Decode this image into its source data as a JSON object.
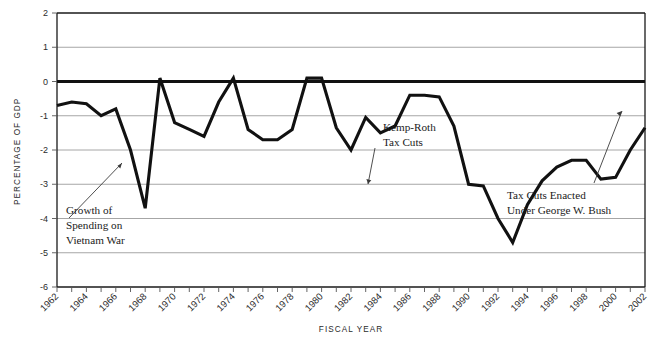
{
  "chart_data": {
    "type": "line",
    "title": "",
    "xlabel": "FISCAL YEAR",
    "ylabel": "PERCENTAGE OF GDP",
    "ylim": [
      -6,
      2
    ],
    "xlim": [
      1962,
      2002
    ],
    "ytick_values": [
      2,
      1,
      0,
      -1,
      -2,
      -3,
      -4,
      -5,
      -6
    ],
    "ytick_labels": [
      "2",
      "1",
      "0",
      "-1",
      "-2",
      "-3",
      "-4",
      "-5",
      "-6"
    ],
    "xtick_labels": [
      "1962",
      "1964",
      "1966",
      "1968",
      "1970",
      "1972",
      "1974",
      "1976",
      "1978",
      "1980",
      "1982",
      "1984",
      "1986",
      "1988",
      "1990",
      "1992",
      "1994",
      "1996",
      "1998",
      "2000",
      "2002"
    ],
    "grid": "horizontal",
    "legend": "none",
    "zero_reference_line": true,
    "series": [
      {
        "name": "Surplus or Deficit as Percentage of GDP",
        "color": "#111111",
        "x": [
          1962,
          1963,
          1964,
          1965,
          1966,
          1967,
          1968,
          1969,
          1970,
          1971,
          1972,
          1973,
          1974,
          1975,
          1976,
          1977,
          1978,
          1979,
          1980,
          1981,
          1982,
          1983,
          1984,
          1985,
          1986,
          1987,
          1988,
          1989,
          1990,
          1991,
          1992,
          1993,
          1994,
          1995,
          1996,
          1997,
          1998,
          1999,
          2000,
          2001,
          2002
        ],
        "values": [
          -0.7,
          -0.6,
          -0.65,
          -1.0,
          -0.8,
          -2.0,
          -3.7,
          0.1,
          -1.2,
          -1.4,
          -1.6,
          -0.6,
          0.1,
          -1.4,
          -1.7,
          -1.7,
          -1.4,
          0.1,
          0.1,
          -1.35,
          -2.0,
          -1.05,
          -1.5,
          -1.3,
          -0.4,
          -0.4,
          -0.45,
          -1.3,
          -3.0,
          -3.05,
          -4.0,
          -4.7,
          -3.6,
          -2.9,
          -2.5,
          -2.3,
          -2.3,
          -2.85,
          -2.8,
          -2.0,
          -1.35
        ]
      }
    ],
    "annotations": [
      {
        "id": "vietnam",
        "text_lines": [
          "Growth of",
          "Spending on",
          "Vietnam War"
        ],
        "points_to_year": 1966,
        "points_to_value": -2.0
      },
      {
        "id": "kemp-roth",
        "text_lines": [
          "Kemp-Roth",
          "Tax Cuts"
        ],
        "points_to_year": 1982,
        "points_to_value": -3.0
      },
      {
        "id": "bush-tax-cuts",
        "text_lines": [
          "Tax Cuts Enacted",
          "Under George W. Bush"
        ],
        "points_to_year": 2001,
        "points_to_value": -1.1
      }
    ]
  },
  "colors": {
    "line": "#111111",
    "grid": "#a6a6a6",
    "axis": "#1a1a1a",
    "text": "#1a1a1a",
    "background": "#ffffff"
  }
}
